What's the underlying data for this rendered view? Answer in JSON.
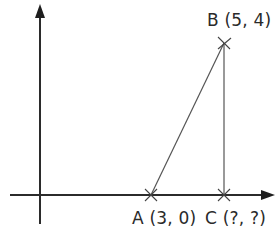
{
  "diagram": {
    "type": "coordinate-geometry",
    "colors": {
      "axis": "#2b2b2b",
      "line": "#555555",
      "text": "#2a2a2a"
    },
    "axes": {
      "x_axis": "horizontal with arrow",
      "y_axis": "vertical with arrow"
    },
    "points": [
      {
        "id": "A",
        "label": "A (3, 0)",
        "x": 3,
        "y": 0
      },
      {
        "id": "B",
        "label": "B (5, 4)",
        "x": 5,
        "y": 4
      },
      {
        "id": "C",
        "label": "C (?, ?)",
        "x": "?",
        "y": "?"
      }
    ],
    "segments": [
      {
        "from": "A",
        "to": "B"
      },
      {
        "from": "B",
        "to": "C"
      }
    ]
  }
}
